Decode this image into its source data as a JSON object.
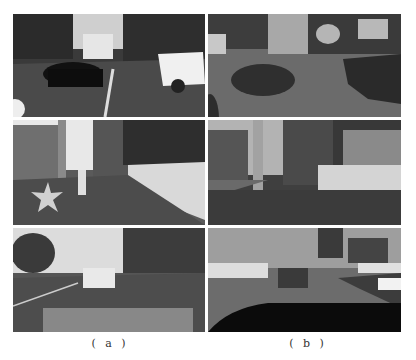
{
  "figure": {
    "columns": [
      {
        "id": "a",
        "label": "( a )",
        "description": "Rendered game frames (photo-realistic)"
      },
      {
        "id": "b",
        "label": "( b )",
        "description": "Semantic segmentation maps"
      }
    ],
    "rows": [
      {
        "id": "row1",
        "scene": "rainy city street with black car and white SUV"
      },
      {
        "id": "row2",
        "scene": "sidewalk with pedestrians, stars on pavement, white wall with fence"
      },
      {
        "id": "row3",
        "scene": "road with white car ahead, puddle reflection, traffic lights"
      }
    ]
  }
}
